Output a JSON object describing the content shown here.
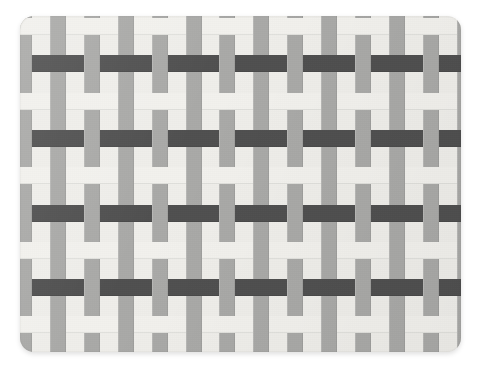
{
  "scene": {
    "title": "Woven placemat",
    "description": "Top-down photograph of a rectangular basket-weave placemat",
    "background_color": "#ffffff",
    "canvas": {
      "width": 480,
      "height": 372
    }
  },
  "object": {
    "name": "placemat",
    "shape": "rounded-rectangle",
    "corner_radius": 14,
    "bounds": {
      "x": 20,
      "y": 16,
      "width": 441,
      "height": 336
    },
    "shadow": "soft drop shadow below and right"
  },
  "weave": {
    "pattern": "plain weave (over-under checkerboard)",
    "warp": {
      "orientation": "vertical",
      "color": "#a9a9a7",
      "strip_width": 16,
      "period": 33.9,
      "offset": -4,
      "count": 14
    },
    "weft": {
      "orientation": "horizontal",
      "strip_height": 17,
      "period": 37.3,
      "offset": 2,
      "count": 10,
      "colors": [
        "#f2f1ed",
        "#4f4f4f"
      ],
      "sequence": "alternating light / dark"
    },
    "colors": {
      "light_weft": "#f2f1ed",
      "dark_weft": "#4f4f4f",
      "warp_gray": "#a9a9a7",
      "mat_base": "#efeeea",
      "seam_shadow": "rgba(0,0,0,0.07)"
    }
  }
}
